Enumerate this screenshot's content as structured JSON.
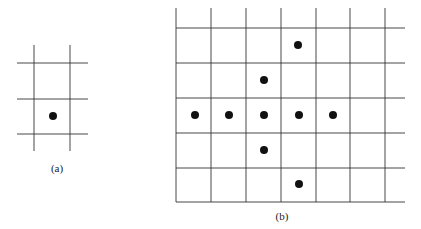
{
  "figure_a": {
    "caption": "(a)",
    "vertical_lines_x": [
      34,
      70
    ],
    "vertical_span": [
      45,
      151
    ],
    "horizontal_lines_y": [
      63,
      99,
      134
    ],
    "horizontal_span": [
      17,
      88
    ],
    "dots": [
      {
        "x": 53,
        "y": 116
      }
    ],
    "caption_pos": {
      "x": 57,
      "y": 172
    }
  },
  "figure_b": {
    "caption": "(b)",
    "vertical_lines_x": [
      176,
      211,
      246,
      281,
      316,
      350,
      385
    ],
    "vertical_span": [
      8,
      202
    ],
    "horizontal_lines_y": [
      28,
      63,
      98,
      133,
      168,
      202
    ],
    "horizontal_span": [
      176,
      405
    ],
    "dots": [
      {
        "x": 298,
        "y": 45
      },
      {
        "x": 264,
        "y": 80
      },
      {
        "x": 195,
        "y": 115
      },
      {
        "x": 229,
        "y": 115
      },
      {
        "x": 264,
        "y": 115
      },
      {
        "x": 299,
        "y": 115
      },
      {
        "x": 333,
        "y": 115
      },
      {
        "x": 264,
        "y": 150
      },
      {
        "x": 299,
        "y": 184
      }
    ],
    "caption_pos": {
      "x": 282,
      "y": 220
    }
  },
  "style": {
    "line_color": "#333333",
    "dot_color": "#111111",
    "dot_radius": 4
  }
}
